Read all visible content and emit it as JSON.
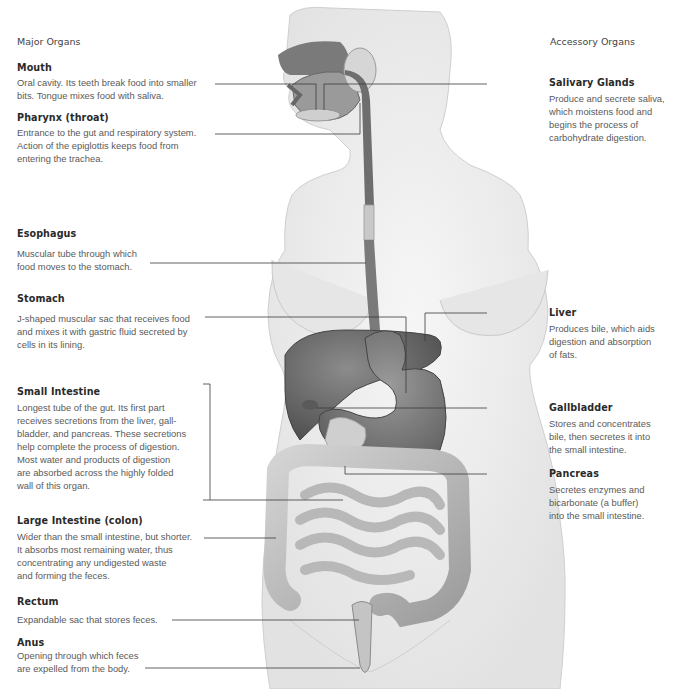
{
  "headers": {
    "left": "Major Organs",
    "right": "Accessory Organs"
  },
  "major_organs": [
    {
      "name": "Mouth",
      "desc_lines": [
        "Oral cavity. Its teeth break food into smaller",
        "bits. Tongue mixes food with saliva."
      ]
    },
    {
      "name": "Pharynx (throat)",
      "desc_lines": [
        "Entrance to the gut and respiratory system.",
        "Action of the epiglottis keeps food from",
        "entering the trachea."
      ]
    },
    {
      "name": "Esophagus",
      "desc_lines": [
        "Muscular tube through which",
        "food moves to the stomach."
      ]
    },
    {
      "name": "Stomach",
      "desc_lines": [
        "J-shaped muscular sac that receives food",
        "and mixes it with gastric fluid secreted by",
        "cells in its lining."
      ]
    },
    {
      "name": "Small Intestine",
      "desc_lines": [
        "Longest tube of the gut. Its first part",
        "receives secretions from the liver, gall-",
        "bladder, and pancreas. These secretions",
        "help complete the process of digestion.",
        "Most water and products of digestion",
        "are absorbed across the highly folded",
        "wall of this organ."
      ]
    },
    {
      "name": "Large Intestine (colon)",
      "desc_lines": [
        "Wider than the small intestine, but shorter.",
        "It absorbs most remaining water, thus",
        "concentrating any undigested waste",
        "and forming the feces."
      ]
    },
    {
      "name": "Rectum",
      "desc_lines": [
        "Expandable sac that stores feces."
      ]
    },
    {
      "name": "Anus",
      "desc_lines": [
        "Opening through which feces",
        "are expelled from the body."
      ]
    }
  ],
  "accessory_organs": [
    {
      "name": "Salivary Glands",
      "desc_lines": [
        "Produce and secrete saliva,",
        "which moistens food and",
        "begins the process of",
        "carbohydrate digestion."
      ]
    },
    {
      "name": "Liver",
      "desc_lines": [
        "Produces bile, which aids",
        "digestion and absorption",
        "of fats."
      ]
    },
    {
      "name": "Gallbladder",
      "desc_lines": [
        "Stores and concentrates",
        "bile, then secretes it into",
        "the small intestine."
      ]
    },
    {
      "name": "Pancreas",
      "desc_lines": [
        "Secretes enzymes and",
        "bicarbonate (a buffer)",
        "into the small intestine."
      ]
    }
  ],
  "colors": {
    "organ": "#6e6e6e",
    "organ_dark": "#4e4e4e",
    "intestine": "#a8a8a8",
    "body": "#ececec",
    "body_outline": "#c8c8c8",
    "leader_line": "#333333"
  }
}
